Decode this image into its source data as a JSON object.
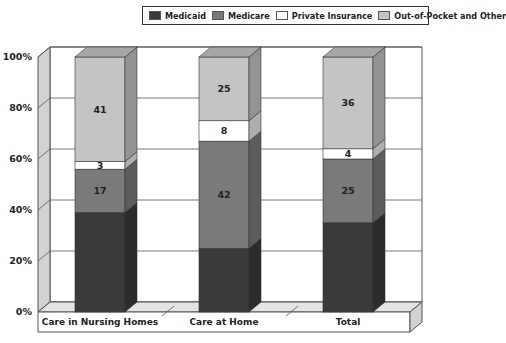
{
  "chart_data": {
    "type": "bar",
    "stacked": true,
    "three_d": true,
    "title": "",
    "xlabel": "",
    "ylabel": "",
    "ylim": [
      0,
      100
    ],
    "y_ticks": [
      "0%",
      "20%",
      "40%",
      "60%",
      "80%",
      "100%"
    ],
    "grid": true,
    "legend_position": "top-right",
    "categories": [
      "Care in Nursing Homes",
      "Care at Home",
      "Total"
    ],
    "series": [
      {
        "name": "Medicaid",
        "color": "#3a3a3a",
        "values": [
          39,
          25,
          35
        ],
        "labels_shown": false
      },
      {
        "name": "Medicare",
        "color": "#7a7a7a",
        "values": [
          17,
          42,
          25
        ],
        "labels_shown": true
      },
      {
        "name": "Private Insurance",
        "color": "#ffffff",
        "values": [
          3,
          8,
          4
        ],
        "labels_shown": true
      },
      {
        "name": "Out-of-Pocket and Other",
        "color": "#c4c4c4",
        "values": [
          41,
          25,
          36
        ],
        "labels_shown": true
      }
    ]
  },
  "legend": {
    "items": [
      {
        "label": "Medicaid",
        "color": "#3a3a3a"
      },
      {
        "label": "Medicare",
        "color": "#7a7a7a"
      },
      {
        "label": "Private Insurance",
        "color": "#ffffff"
      },
      {
        "label": "Out-of-Pocket and Other",
        "color": "#c4c4c4"
      }
    ]
  }
}
